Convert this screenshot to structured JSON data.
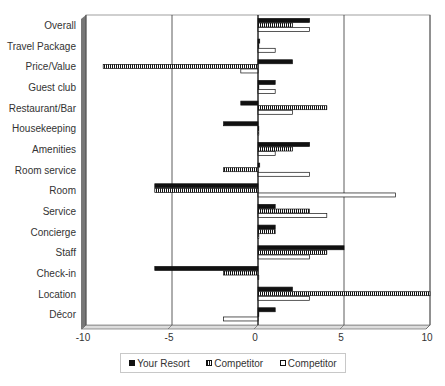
{
  "chart_data": {
    "type": "bar",
    "orientation": "horizontal",
    "title": "",
    "xlabel": "",
    "ylabel": "",
    "xlim": [
      -10,
      10
    ],
    "x_ticks": [
      -10,
      -5,
      0,
      5,
      10
    ],
    "grid": {
      "vertical": true,
      "horizontal": false
    },
    "legend_position": "bottom",
    "categories": [
      "Overall",
      "Travel Package",
      "Price/Value",
      "Guest club",
      "Restaurant/Bar",
      "Housekeeping",
      "Amenities",
      "Room service",
      "Room",
      "Service",
      "Concierge",
      "Staff",
      "Check-in",
      "Location",
      "Décor"
    ],
    "series": [
      {
        "name": "Your Resort",
        "style": "solid",
        "values": [
          3,
          0.1,
          2,
          1,
          -1,
          -2,
          3,
          0.1,
          -6,
          1,
          1,
          5,
          -6,
          2,
          1
        ]
      },
      {
        "name": "Competitor",
        "style": "striped",
        "values": [
          2,
          0,
          -9,
          0,
          4,
          0,
          2,
          -2,
          -6,
          3,
          1,
          4,
          -2,
          10,
          0
        ]
      },
      {
        "name": "Competitor",
        "style": "white",
        "values": [
          3,
          1,
          -1,
          1,
          2,
          0,
          1,
          3,
          8,
          4,
          0,
          3,
          0,
          3,
          -2
        ]
      }
    ]
  },
  "legend": {
    "items": [
      {
        "label": "Your Resort",
        "style": "solid"
      },
      {
        "label": "Competitor",
        "style": "striped"
      },
      {
        "label": "Competitor",
        "style": "white"
      }
    ]
  },
  "colors": {
    "solid": "#111111",
    "frame": "#222222",
    "wall": "#777777"
  }
}
